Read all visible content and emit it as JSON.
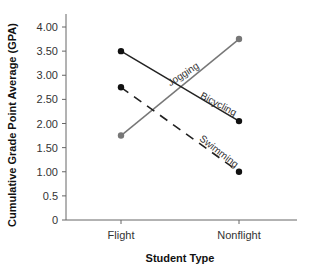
{
  "chart_data": {
    "type": "line",
    "title": "",
    "xlabel": "Student Type",
    "ylabel": "Cumulative Grade Point Average (GPA)",
    "categories": [
      "Flight",
      "Nonflight"
    ],
    "y_ticks": [
      "0",
      "0.5",
      "1.00",
      "1.50",
      "2.00",
      "2.50",
      "3.00",
      "3.50",
      "4.00"
    ],
    "ylim": [
      0,
      4.0
    ],
    "grid": false,
    "legend": "inline labels on lines",
    "series": [
      {
        "name": "Jogging",
        "values": [
          1.75,
          3.75
        ],
        "style": "solid",
        "color": "#777777",
        "marker_color": "#777777"
      },
      {
        "name": "Bicycling",
        "values": [
          3.5,
          2.05
        ],
        "style": "solid",
        "color": "#222222",
        "marker_color": "#111111"
      },
      {
        "name": "Swimming",
        "values": [
          2.75,
          1.0
        ],
        "style": "dashed",
        "color": "#222222",
        "marker_color": "#111111"
      }
    ]
  }
}
